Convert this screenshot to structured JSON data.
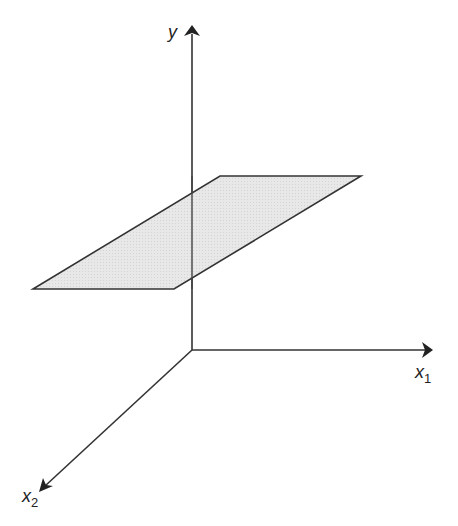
{
  "diagram": {
    "axes": {
      "y": {
        "label": "y",
        "subscript": ""
      },
      "x1": {
        "label": "x",
        "subscript": "1"
      },
      "x2": {
        "label": "x",
        "subscript": "2"
      }
    },
    "plane": {
      "fill": "#e6e6e6",
      "stroke": "#333333"
    },
    "colors": {
      "axis": "#333333",
      "background": "#ffffff"
    }
  }
}
